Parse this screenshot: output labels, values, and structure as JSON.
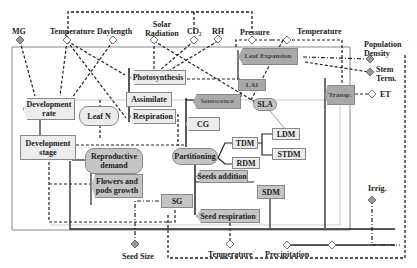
{
  "inputs_top": {
    "mg": "MG",
    "temperature": "Temperature",
    "daylength": "Daylength",
    "solar_radiation_1": "Solar",
    "solar_radiation_2": "Radiation",
    "co2": "CO₂",
    "rh": "RH",
    "pressure": "Pressure",
    "temperature_right": "Temperature"
  },
  "inputs_right": {
    "population_density_1": "Population",
    "population_density_2": "Density",
    "stem_term_1": "Stem",
    "stem_term_2": "Term.",
    "et": "ET",
    "irrig": "Irrig."
  },
  "inputs_bottom": {
    "seed_size": "Seed Size",
    "temperature": "Temperature",
    "precipitation": "Precipitation"
  },
  "nodes": {
    "development_rate_1": "Development",
    "development_rate_2": "rate",
    "development_stage_1": "Development",
    "development_stage_2": "stage",
    "leaf_n": "Leaf N",
    "photosynthesis": "Photosynthesis",
    "assimilate": "Assimilate",
    "respiration": "Respiration",
    "senescence": "Senescence",
    "cg": "CG",
    "leaf_expansion": "Leaf Expansion",
    "lai": "LAI",
    "sla": "SLA",
    "transp": "Transp.",
    "partitioning": "Partitioning",
    "tdm": "TDM",
    "rdm": "RDM",
    "ldm": "LDM",
    "stdm": "STDM",
    "reproductive_demand_1": "Reproductive",
    "reproductive_demand_2": "demand",
    "flowers_pods_1": "Flowers and",
    "flowers_pods_2": "pods growth",
    "seeds_addition": "Seeds addition",
    "sg": "SG",
    "sdm": "SDM",
    "seed_respiration": "Seed respiration"
  },
  "colors": {
    "light_box": "#ececec",
    "dark_box": "#a9a9a9",
    "border": "#888888"
  }
}
